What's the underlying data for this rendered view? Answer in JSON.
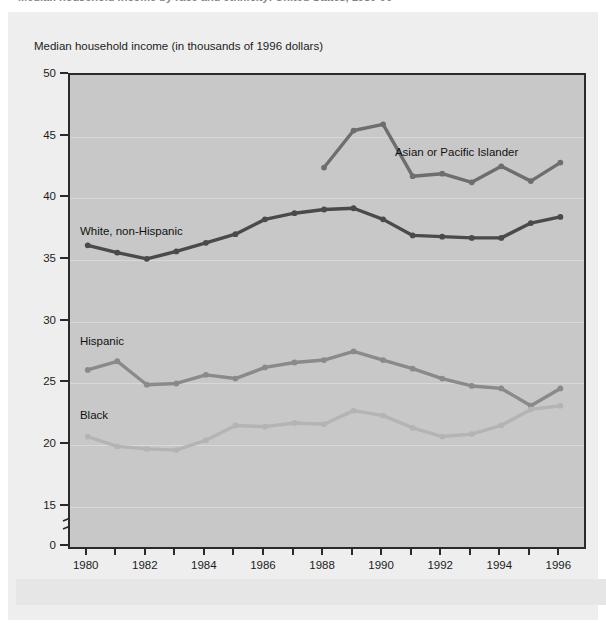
{
  "figure": {
    "cropped_title": "Median household income by race and ethnicity: United States, 1980-96",
    "axis_title": "Median household income (in thousands of 1996 dollars)"
  },
  "colors": {
    "plot_background": "#c8c8c8",
    "page_background": "#eeeeee",
    "axis": "#2a2a2a",
    "gridline": "#d8d8d8",
    "asian": "#6e6e6e",
    "white_non_hispanic": "#4a4a4a",
    "hispanic": "#8a8a8a",
    "black": "#b4b4b4"
  },
  "series_labels": {
    "asian": "Asian or Pacific Islander",
    "white": "White, non-Hispanic",
    "hispanic": "Hispanic",
    "black": "Black"
  },
  "chart_data": {
    "type": "line",
    "title": "Median household income by race and ethnicity: United States, 1980-96",
    "xlabel": "",
    "ylabel": "Median household income (in thousands of 1996 dollars)",
    "x": [
      1980,
      1981,
      1982,
      1983,
      1984,
      1985,
      1986,
      1987,
      1988,
      1989,
      1990,
      1991,
      1992,
      1993,
      1994,
      1995,
      1996
    ],
    "xlim": [
      1979.4,
      1996.8
    ],
    "ylim": [
      0,
      50
    ],
    "y_ticks": [
      0,
      15,
      20,
      25,
      30,
      35,
      40,
      45,
      50
    ],
    "y_axis_break_between": [
      0,
      15
    ],
    "x_ticks": [
      1980,
      1981,
      1982,
      1983,
      1984,
      1985,
      1986,
      1987,
      1988,
      1989,
      1990,
      1991,
      1992,
      1993,
      1994,
      1995,
      1996
    ],
    "x_tick_labels": [
      "1980",
      "",
      "1982",
      "",
      "1984",
      "",
      "1986",
      "",
      "1988",
      "",
      "1990",
      "",
      "1992",
      "",
      "1994",
      "",
      "1996"
    ],
    "grid": "horizontal",
    "legend": "inline-annotations",
    "series": [
      {
        "name": "Asian or Pacific Islander",
        "color": "#6e6e6e",
        "x": [
          1988,
          1989,
          1990,
          1991,
          1992,
          1993,
          1994,
          1995,
          1996
        ],
        "values": [
          42.5,
          45.5,
          46.0,
          41.8,
          42.0,
          41.3,
          42.6,
          41.4,
          42.9
        ]
      },
      {
        "name": "White, non-Hispanic",
        "color": "#4a4a4a",
        "x": [
          1980,
          1981,
          1982,
          1983,
          1984,
          1985,
          1986,
          1987,
          1988,
          1989,
          1990,
          1991,
          1992,
          1993,
          1994,
          1995,
          1996
        ],
        "values": [
          36.2,
          35.6,
          35.1,
          35.7,
          36.4,
          37.1,
          38.3,
          38.8,
          39.1,
          39.2,
          38.3,
          37.0,
          36.9,
          36.8,
          36.8,
          38.0,
          38.5
        ]
      },
      {
        "name": "Hispanic",
        "color": "#8a8a8a",
        "x": [
          1980,
          1981,
          1982,
          1983,
          1984,
          1985,
          1986,
          1987,
          1988,
          1989,
          1990,
          1991,
          1992,
          1993,
          1994,
          1995,
          1996
        ],
        "values": [
          26.1,
          26.8,
          24.9,
          25.0,
          25.7,
          25.4,
          26.3,
          26.7,
          26.9,
          27.6,
          26.9,
          26.2,
          25.4,
          24.8,
          24.6,
          23.2,
          24.6
        ]
      },
      {
        "name": "Black",
        "color": "#b4b4b4",
        "x": [
          1980,
          1981,
          1982,
          1983,
          1984,
          1985,
          1986,
          1987,
          1988,
          1989,
          1990,
          1991,
          1992,
          1993,
          1994,
          1995,
          1996
        ],
        "values": [
          20.7,
          19.9,
          19.7,
          19.6,
          20.4,
          21.6,
          21.5,
          21.8,
          21.7,
          22.8,
          22.4,
          21.4,
          20.7,
          20.9,
          21.6,
          22.9,
          23.2
        ]
      }
    ]
  }
}
